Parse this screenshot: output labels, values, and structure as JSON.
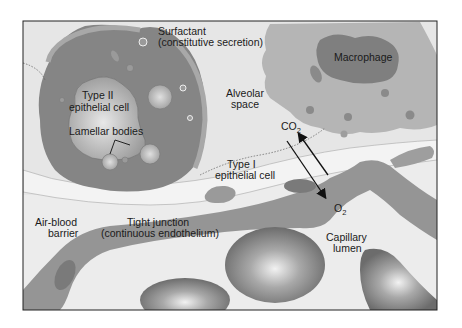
{
  "diagram": {
    "labels": {
      "surfactant_line1": "Surfactant",
      "surfactant_line2": "(constitutive secretion)",
      "macrophage": "Macrophage",
      "type2_line1": "Type II",
      "type2_line2": "epithelial cell",
      "lamellar": "Lamellar bodies",
      "alveolar_line1": "Alveolar",
      "alveolar_line2": "space",
      "co2_main": "CO",
      "co2_sub": "2",
      "o2_main": "O",
      "o2_sub": "2",
      "type1_line1": "Type I",
      "type1_line2": "epithelial cell",
      "airblood_line1": "Air-blood",
      "airblood_line2": "barrier",
      "tight_line1": "Tight junction",
      "tight_line2": "(continuous endothelium)",
      "capillary_line1": "Capillary",
      "capillary_line2": "lumen"
    },
    "colors": {
      "background": "#ececec",
      "alveolar_space": "#e9e9e9",
      "cell_dark": "#8a8a8a",
      "cell_mid": "#a9a9a9",
      "macrophage_body": "#b3b3b3",
      "macrophage_nucleus": "#7e7e7e",
      "rbc": "#8c8c8c",
      "frame": "#222222"
    }
  }
}
